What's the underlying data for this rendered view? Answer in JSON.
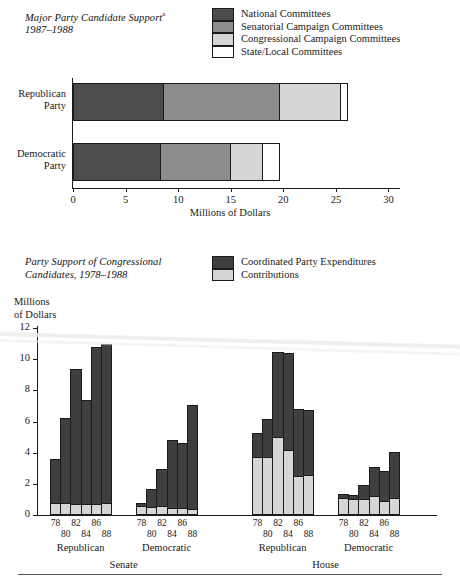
{
  "chart_data": [
    {
      "type": "bar",
      "orientation": "horizontal",
      "stacked": true,
      "title": "Major Party Candidate Support",
      "title_superscript": "a",
      "subtitle": "1987–1988",
      "xlabel": "Millions of Dollars",
      "ylabel": "",
      "xlim": [
        0,
        31
      ],
      "xticks": [
        0,
        5,
        10,
        15,
        20,
        25,
        30
      ],
      "categories": [
        "Republican Party",
        "Democratic Party"
      ],
      "grid": false,
      "legend_position": "top-right",
      "series": [
        {
          "name": "National Committees",
          "color": "#4c4c4c",
          "values": [
            8.6,
            8.3
          ]
        },
        {
          "name": "Senatorial Campaign Committees",
          "color": "#8d8d8d",
          "values": [
            11.0,
            6.6
          ]
        },
        {
          "name": "Congressional Campaign Committees",
          "color": "#d6d6d6",
          "values": [
            5.8,
            3.1
          ]
        },
        {
          "name": "State/Local Committees",
          "color": "#ffffff",
          "values": [
            0.7,
            1.6
          ]
        }
      ],
      "totals": [
        26.1,
        19.6
      ]
    },
    {
      "type": "bar",
      "orientation": "vertical",
      "stacked": true,
      "title": "Party Support of Congressional Candidates, 1978–1988",
      "ylabel": "Millions of Dollars",
      "xlabel": "",
      "ylim": [
        0,
        12
      ],
      "yticks": [
        0,
        2,
        4,
        6,
        8,
        10,
        12
      ],
      "grid": false,
      "legend_position": "top-right",
      "legend": [
        {
          "name": "Coordinated Party Expenditures",
          "color": "#3f3f3f"
        },
        {
          "name": "Contributions",
          "color": "#d6d6d6"
        }
      ],
      "years": [
        "78",
        "80",
        "82",
        "84",
        "86",
        "88"
      ],
      "chambers": [
        {
          "name": "Senate",
          "parties": [
            {
              "name": "Republican",
              "contributions": [
                0.8,
                0.8,
                0.7,
                0.7,
                0.72,
                0.75
              ],
              "coordinated": [
                2.8,
                5.4,
                8.7,
                6.7,
                10.08,
                10.25
              ],
              "totals": [
                3.6,
                6.2,
                9.4,
                7.4,
                10.8,
                11.0
              ]
            },
            {
              "name": "Democratic",
              "contributions": [
                0.55,
                0.5,
                0.55,
                0.45,
                0.45,
                0.4
              ],
              "coordinated": [
                0.25,
                1.2,
                2.4,
                4.35,
                4.2,
                6.65
              ],
              "totals": [
                0.8,
                1.7,
                2.95,
                4.8,
                4.65,
                7.05
              ]
            }
          ]
        },
        {
          "name": "House",
          "parties": [
            {
              "name": "Republican",
              "contributions": [
                3.75,
                3.75,
                5.0,
                4.2,
                2.5,
                2.55
              ],
              "coordinated": [
                1.5,
                2.4,
                5.45,
                6.2,
                4.3,
                4.2
              ],
              "totals": [
                5.25,
                6.15,
                10.45,
                10.4,
                6.8,
                6.75
              ]
            },
            {
              "name": "Democratic",
              "contributions": [
                1.1,
                1.0,
                1.05,
                1.2,
                0.9,
                1.1
              ],
              "coordinated": [
                0.25,
                0.3,
                0.85,
                1.9,
                1.9,
                2.95
              ],
              "totals": [
                1.35,
                1.3,
                1.9,
                3.1,
                2.8,
                4.05
              ]
            }
          ]
        }
      ]
    }
  ],
  "chart1": {
    "title_main": "Major Party Candidate Support",
    "title_sup": "a",
    "title_years": "1987–1988",
    "x_axis_title": "Millions of Dollars",
    "xticks": [
      "0",
      "5",
      "10",
      "15",
      "20",
      "25",
      "30"
    ],
    "bars": [
      {
        "label_line1": "Republican",
        "label_line2": "Party"
      },
      {
        "label_line1": "Democratic",
        "label_line2": "Party"
      }
    ],
    "legend": [
      "National Committees",
      "Senatorial Campaign Committees",
      "Congressional Campaign Committees",
      "State/Local Committees"
    ]
  },
  "chart2": {
    "title_line1": "Party Support of Congressional",
    "title_line2": "Candidates, 1978–1988",
    "y_axis_title_line1": "Millions",
    "y_axis_title_line2": "of Dollars",
    "yticks": [
      "12",
      "10",
      "8",
      "6",
      "4",
      "2",
      "0"
    ],
    "legend": [
      "Coordinated Party Expenditures",
      "Contributions"
    ],
    "group_labels": [
      "Republican",
      "Democratic",
      "Republican",
      "Democratic"
    ],
    "chamber_labels": [
      "Senate",
      "House"
    ],
    "year_labels": [
      "78",
      "80",
      "82",
      "84",
      "86",
      "88"
    ]
  },
  "colors": {
    "national": "#4c4c4c",
    "senatorial": "#8d8d8d",
    "congressional": "#d6d6d6",
    "state_local": "#ffffff",
    "coordinated": "#3f3f3f",
    "contributions": "#d6d6d6",
    "axis": "#1a1a1a"
  }
}
